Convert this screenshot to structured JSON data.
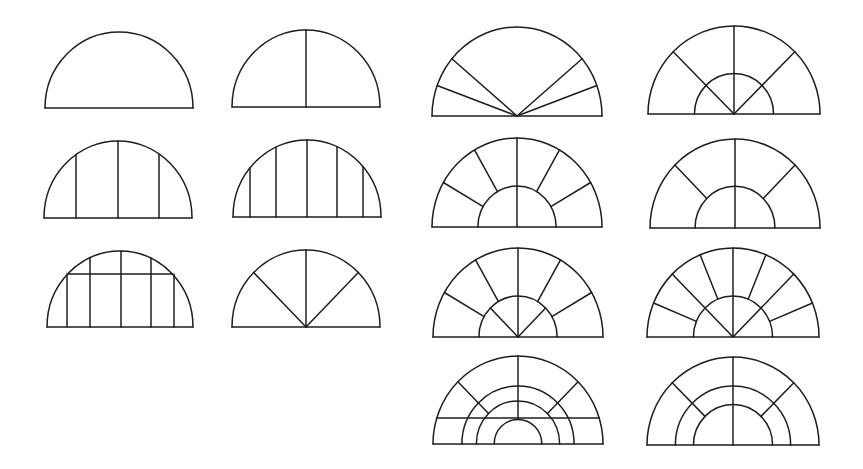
{
  "figure": {
    "title": "Semicircular window mullion patterns",
    "background": "#ffffff",
    "stroke_color": "#1e1e1e",
    "stroke_width": 1.5
  },
  "windows": [
    {
      "id": "plain",
      "label": "Plain semicircle",
      "cx": 119,
      "baseline": 108,
      "rx": 74,
      "ry": 76,
      "arcs": [],
      "verticals": [],
      "horizontals": [],
      "radials": []
    },
    {
      "id": "single-center-mullion",
      "label": "Single center mullion",
      "cx": 306,
      "baseline": 107,
      "rx": 74,
      "ry": 77,
      "arcs": [],
      "verticals": [
        {
          "dx": 0,
          "from": "base",
          "to": "outer"
        }
      ],
      "horizontals": [],
      "radials": []
    },
    {
      "id": "three-verticals",
      "label": "Three vertical mullions",
      "cx": 118,
      "baseline": 218,
      "rx": 74,
      "ry": 77,
      "arcs": [],
      "verticals": [
        {
          "dx": -42,
          "from": "base",
          "to": "outer"
        },
        {
          "dx": 0,
          "from": "base",
          "to": "outer"
        },
        {
          "dx": 41,
          "from": "base",
          "to": "outer"
        }
      ],
      "horizontals": [],
      "radials": []
    },
    {
      "id": "five-verticals",
      "label": "Five vertical mullions",
      "cx": 307,
      "baseline": 217,
      "rx": 74,
      "ry": 77,
      "arcs": [],
      "verticals": [
        {
          "dx": -57,
          "from": "base",
          "to": "outer"
        },
        {
          "dx": -31,
          "from": "base",
          "to": "outer"
        },
        {
          "dx": 0,
          "from": "base",
          "to": "outer"
        },
        {
          "dx": 30,
          "from": "base",
          "to": "outer"
        },
        {
          "dx": 56,
          "from": "base",
          "to": "outer"
        }
      ],
      "horizontals": [],
      "radials": []
    },
    {
      "id": "grid-with-transom",
      "label": "Vertical mullions with transom bar",
      "cx": 120,
      "baseline": 327,
      "rx": 73,
      "ry": 76,
      "arcs": [],
      "verticals": [
        {
          "dx": -53,
          "from": "base",
          "to": "transom"
        },
        {
          "dx": -30,
          "from": "base",
          "to": "outer"
        },
        {
          "dx": 1,
          "from": "base",
          "to": "outer"
        },
        {
          "dx": 31,
          "from": "base",
          "to": "outer"
        },
        {
          "dx": 54,
          "from": "base",
          "to": "transom"
        }
      ],
      "horizontals": [
        {
          "dy": 53,
          "name": "transom"
        }
      ],
      "radials": []
    },
    {
      "id": "three-radial-fan",
      "label": "Three-radial fan",
      "cx": 306,
      "baseline": 327,
      "rx": 74,
      "ry": 77,
      "arcs": [],
      "verticals": [],
      "horizontals": [],
      "radials": [
        {
          "angle": 45,
          "from": 0
        },
        {
          "angle": 90,
          "from": 0
        },
        {
          "angle": 135,
          "from": 0
        }
      ]
    },
    {
      "id": "low-angle-fan",
      "label": "Four-radial low-angle fan",
      "cx": 517,
      "baseline": 116,
      "rx": 85,
      "ry": 89,
      "arcs": [],
      "verticals": [],
      "horizontals": [],
      "radials": [
        {
          "angle": 20,
          "from": 0
        },
        {
          "angle": 40,
          "from": 0
        },
        {
          "angle": 140,
          "from": 0
        },
        {
          "angle": 160,
          "from": 0
        }
      ]
    },
    {
      "id": "fan-with-hub",
      "label": "Three-radial fan with inner hub arc",
      "cx": 734,
      "baseline": 114,
      "rx": 86,
      "ry": 88,
      "arcs": [
        {
          "r": 0.46
        }
      ],
      "verticals": [],
      "horizontals": [],
      "radials": [
        {
          "angle": 45,
          "from": 0
        },
        {
          "angle": 90,
          "from": 0
        },
        {
          "angle": 135,
          "from": 0
        }
      ]
    },
    {
      "id": "hub-five-spokes",
      "label": "Inner hub with five outer spokes",
      "cx": 517,
      "baseline": 227,
      "rx": 85,
      "ry": 89,
      "arcs": [
        {
          "r": 0.46
        }
      ],
      "verticals": [],
      "horizontals": [],
      "radials": [
        {
          "angle": 30,
          "from": 0.46
        },
        {
          "angle": 60,
          "from": 0.46
        },
        {
          "angle": 90,
          "from": 0
        },
        {
          "angle": 120,
          "from": 0.46
        },
        {
          "angle": 150,
          "from": 0.46
        }
      ]
    },
    {
      "id": "hub-three-spokes",
      "label": "Inner hub with three outer spokes",
      "cx": 735,
      "baseline": 228,
      "rx": 85,
      "ry": 89,
      "arcs": [
        {
          "r": 0.47
        }
      ],
      "verticals": [],
      "horizontals": [],
      "radials": [
        {
          "angle": 45,
          "from": 0.47
        },
        {
          "angle": 90,
          "from": 0
        },
        {
          "angle": 135,
          "from": 0.47
        }
      ]
    },
    {
      "id": "hub-five-spokes-inner-fan",
      "label": "Inner fan hub with five outer spokes",
      "cx": 518,
      "baseline": 337,
      "rx": 85,
      "ry": 89,
      "arcs": [
        {
          "r": 0.46
        }
      ],
      "verticals": [],
      "horizontals": [],
      "radials": [
        {
          "angle": 30,
          "from": 0.46
        },
        {
          "angle": 45,
          "from": 0,
          "to": 0.46
        },
        {
          "angle": 60,
          "from": 0.46
        },
        {
          "angle": 90,
          "from": 0
        },
        {
          "angle": 120,
          "from": 0.46
        },
        {
          "angle": 135,
          "from": 0,
          "to": 0.46
        },
        {
          "angle": 150,
          "from": 0.46
        }
      ]
    },
    {
      "id": "nine-spoke-sunburst",
      "label": "Nine-spoke sunburst with hub",
      "cx": 733,
      "baseline": 337,
      "rx": 86,
      "ry": 89,
      "arcs": [
        {
          "r": 0.46
        }
      ],
      "verticals": [],
      "horizontals": [],
      "radials": [
        {
          "angle": 22.5,
          "from": 0.46
        },
        {
          "angle": 45,
          "from": 0
        },
        {
          "angle": 67.5,
          "from": 0.46
        },
        {
          "angle": 90,
          "from": 0
        },
        {
          "angle": 112.5,
          "from": 0.46
        },
        {
          "angle": 135,
          "from": 0
        },
        {
          "angle": 157.5,
          "from": 0.46
        }
      ]
    },
    {
      "id": "concentric-with-transom",
      "label": "Three concentric arcs with transom",
      "cx": 518,
      "baseline": 444,
      "rx": 85,
      "ry": 88,
      "arcs": [
        {
          "r": 0.66
        },
        {
          "r": 0.49
        },
        {
          "r": 0.28
        }
      ],
      "verticals": [],
      "horizontals": [
        {
          "dy": 26,
          "name": "transom"
        }
      ],
      "radials": [
        {
          "angle": 45,
          "from": 0.49
        },
        {
          "angle": 90,
          "from": 0.28
        },
        {
          "angle": 135,
          "from": 0.49
        }
      ]
    },
    {
      "id": "double-concentric",
      "label": "Two concentric arcs with spokes",
      "cx": 733,
      "baseline": 445,
      "rx": 86,
      "ry": 88,
      "arcs": [
        {
          "r": 0.67
        },
        {
          "r": 0.46
        }
      ],
      "verticals": [],
      "horizontals": [],
      "radials": [
        {
          "angle": 45,
          "from": 0.46
        },
        {
          "angle": 90,
          "from": 0
        },
        {
          "angle": 135,
          "from": 0.46
        }
      ]
    }
  ]
}
